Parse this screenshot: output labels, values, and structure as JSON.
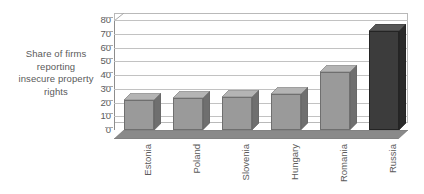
{
  "caption": {
    "lines": [
      "Share of firms",
      "reporting",
      "insecure property",
      "rights"
    ]
  },
  "colors": {
    "bar": "#9a9a9a",
    "bar_highlight": "#3c3c3c",
    "gridline": "#c2c2c2",
    "axis": "#8d8d8d",
    "text": "#5a5a5a",
    "background": "#ffffff"
  },
  "chart_data": {
    "type": "bar",
    "title": "",
    "subtitle": "",
    "xlabel": "",
    "ylabel": "",
    "categories": [
      "Estonia",
      "Poland",
      "Slovenia",
      "Hungary",
      "Romania",
      "Russia"
    ],
    "values": [
      22,
      23,
      24,
      26,
      42,
      72
    ],
    "series": [
      {
        "name": "Share of firms reporting insecure property rights",
        "values": [
          22,
          23,
          24,
          26,
          42,
          72
        ]
      }
    ],
    "ylim": [
      0,
      80
    ],
    "yticks": [
      0,
      10,
      20,
      30,
      40,
      50,
      60,
      70,
      80
    ],
    "ytick_labels": [
      "0",
      "10",
      "20",
      "30",
      "40",
      "50",
      "60",
      "70",
      "80"
    ],
    "grid": true,
    "legend": false,
    "legend_position": "none",
    "style": "3d-bar",
    "highlight_category": "Russia",
    "xlabel_rotation": -90
  }
}
